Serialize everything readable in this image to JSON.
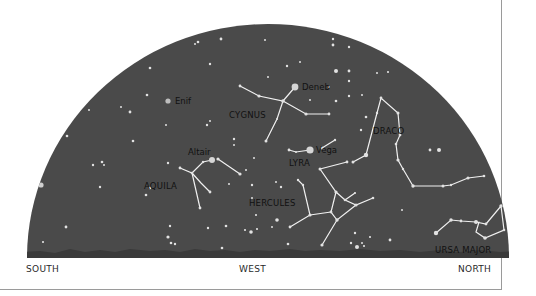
{
  "colors": {
    "sky": "#4a4a4a",
    "horizon": "#3a3a3a",
    "star": "#e0e0e0",
    "line": "#f2f2f2",
    "label": "#111111",
    "background": "#ffffff"
  },
  "directions": {
    "south": "SOUTH",
    "west": "WEST",
    "north": "NORTH"
  },
  "stars_named": [
    {
      "name": "Enif",
      "x": 168,
      "y": 101
    },
    {
      "name": "Deneb",
      "x": 295,
      "y": 87
    },
    {
      "name": "Vega",
      "x": 310,
      "y": 150
    },
    {
      "name": "Altair",
      "x": 212,
      "y": 160
    }
  ],
  "constellations": [
    {
      "name": "CYGNUS",
      "x": 229,
      "y": 115
    },
    {
      "name": "LYRA",
      "x": 290,
      "y": 163
    },
    {
      "name": "DRACO",
      "x": 373,
      "y": 131
    },
    {
      "name": "AQUILA",
      "x": 145,
      "y": 186
    },
    {
      "name": "HERCULES",
      "x": 249,
      "y": 203
    },
    {
      "name": "URSA MAJOR",
      "x": 436,
      "y": 251
    }
  ]
}
